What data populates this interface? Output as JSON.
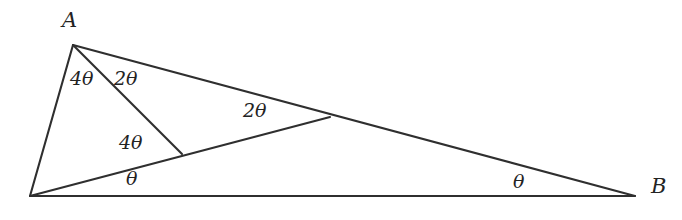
{
  "figure": {
    "background_color": "#ffffff",
    "line_color": "#2f2f2f",
    "text_color": "#232323",
    "vertices": [
      {
        "id": "A",
        "label": "A",
        "x": 73,
        "y": 45,
        "label_x": 62,
        "label_y": 10
      },
      {
        "id": "B",
        "label": "B",
        "x": 635,
        "y": 196,
        "label_x": 651,
        "label_y": 176
      },
      {
        "id": "C",
        "label": "",
        "x": 30,
        "y": 196,
        "label_x": 0,
        "label_y": 0
      },
      {
        "id": "D",
        "label": "",
        "x": 182,
        "y": 154,
        "label_x": 0,
        "label_y": 0
      },
      {
        "id": "E",
        "label": "",
        "x": 330,
        "y": 117,
        "label_x": 0,
        "label_y": 0
      }
    ],
    "segments": [
      {
        "id": "A-C",
        "from": "A",
        "to": "C"
      },
      {
        "id": "A-D",
        "from": "A",
        "to": "D"
      },
      {
        "id": "A-B",
        "from": "A",
        "to": "B"
      },
      {
        "id": "C-B",
        "from": "C",
        "to": "B"
      },
      {
        "id": "C-E",
        "from": "C",
        "to": "E"
      },
      {
        "id": "D-E",
        "from": "D",
        "to": "E"
      },
      {
        "id": "E-B",
        "from": "E",
        "to": "B"
      }
    ],
    "angle_labels": [
      {
        "id": "angle-A-outer",
        "text": "4θ",
        "x": 70,
        "y": 69,
        "at_vertex": "A"
      },
      {
        "id": "angle-A-inner",
        "text": "2θ",
        "x": 114,
        "y": 69,
        "at_vertex": "A"
      },
      {
        "id": "angle-D",
        "text": "4θ",
        "x": 119,
        "y": 133,
        "at_vertex": "D"
      },
      {
        "id": "angle-C",
        "text": "θ",
        "x": 126,
        "y": 169,
        "at_vertex": "C"
      },
      {
        "id": "angle-E",
        "text": "2θ",
        "x": 243,
        "y": 101,
        "at_vertex": "E"
      },
      {
        "id": "angle-B",
        "text": "θ",
        "x": 513,
        "y": 172,
        "at_vertex": "B"
      }
    ]
  }
}
